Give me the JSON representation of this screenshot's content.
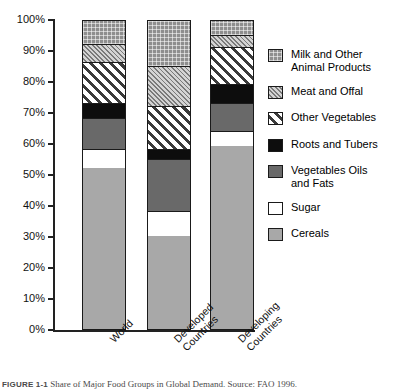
{
  "chart_data": {
    "type": "bar",
    "subtype": "stacked-bar-100-percent",
    "title": "",
    "xlabel": "",
    "ylabel": "",
    "ylim": [
      0,
      100
    ],
    "grid": false,
    "legend_position": "right",
    "categories": [
      "World",
      "Developed Countries",
      "Developing Countries"
    ],
    "tick_labels": [
      "100%",
      "90%",
      "80%",
      "70%",
      "60%",
      "50%",
      "40%",
      "30%",
      "20%",
      "10%",
      "0%"
    ],
    "tick_values": [
      100,
      90,
      80,
      70,
      60,
      50,
      40,
      30,
      20,
      10,
      0
    ],
    "series": [
      {
        "name": "Cereals",
        "pattern": "solid-light-gray",
        "color": "#a8a8a8",
        "values": [
          52,
          30,
          59
        ]
      },
      {
        "name": "Sugar",
        "pattern": "solid-white",
        "color": "#ffffff",
        "values": [
          6,
          8,
          5
        ]
      },
      {
        "name": "Vegetables Oils and Fats",
        "pattern": "solid-dark-gray",
        "color": "#696969",
        "values": [
          10,
          17,
          9
        ]
      },
      {
        "name": "Roots and Tubers",
        "pattern": "solid-black",
        "color": "#0d0d0d",
        "values": [
          5,
          3,
          6
        ]
      },
      {
        "name": "Other Vegetables",
        "pattern": "bold-diagonal-hatch",
        "color": "#3a3a3a",
        "values": [
          13,
          14,
          12
        ]
      },
      {
        "name": "Meat and Offal",
        "pattern": "fine-diagonal-hatch",
        "color": "#7a7a7a",
        "values": [
          6,
          13,
          4
        ]
      },
      {
        "name": "Milk and Other Animal Products",
        "pattern": "checkered-gray",
        "color": "#8e8e8e",
        "values": [
          8,
          15,
          5
        ]
      }
    ],
    "cumulative_tops": {
      "World": [
        "52",
        "58",
        "68",
        "73",
        "86",
        "92",
        "100"
      ],
      "Developed Countries": [
        "30",
        "38",
        "55",
        "58",
        "72",
        "85",
        "100"
      ],
      "Developing Countries": [
        "59",
        "64",
        "73",
        "79",
        "91",
        "95",
        "100"
      ]
    }
  },
  "legend": {
    "items": [
      {
        "label": "Milk and Other\nAnimal Products"
      },
      {
        "label": "Meat and Offal"
      },
      {
        "label": "Other Vegetables"
      },
      {
        "label": "Roots and Tubers"
      },
      {
        "label": "Vegetables Oils\nand Fats"
      },
      {
        "label": "Sugar"
      },
      {
        "label": "Cereals"
      }
    ]
  },
  "caption": {
    "figure_number": "FIGURE 1-1",
    "text": "Share of Major Food Groups in Global Demand. Source: FAO 1996."
  }
}
